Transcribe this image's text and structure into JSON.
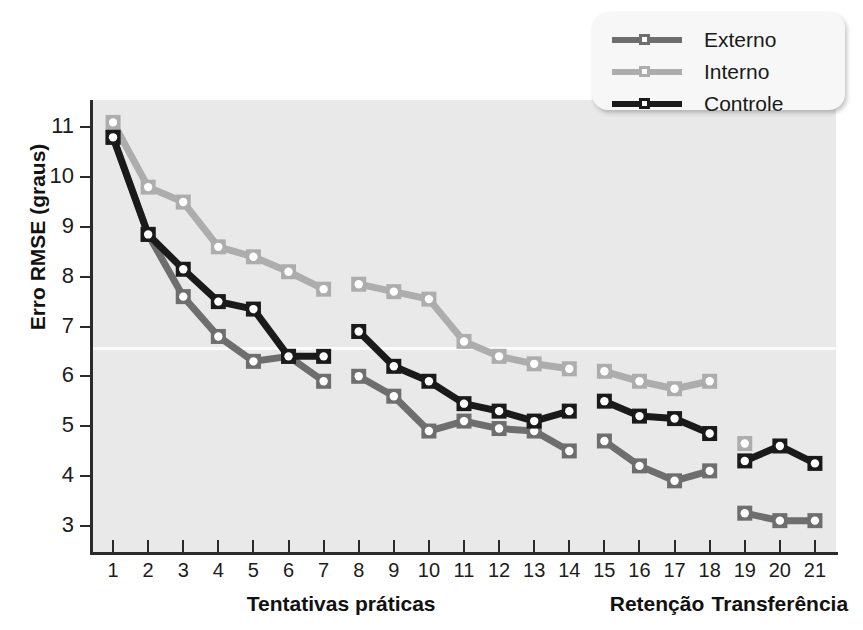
{
  "chart_data": {
    "type": "line",
    "title": "",
    "xlabel": "Tentativas práticas",
    "ylabel": "Erro RMSE (graus)",
    "xlim": [
      0.4,
      21.6
    ],
    "ylim": [
      2.45,
      11.55
    ],
    "grid": false,
    "legend_position": "top-right",
    "y_ticks": [
      3,
      4,
      5,
      6,
      7,
      8,
      9,
      10,
      11
    ],
    "y_tick_labels": [
      "3",
      "4",
      "5",
      "6",
      "7",
      "8",
      "9",
      "10",
      "11"
    ],
    "x": [
      1,
      2,
      3,
      4,
      5,
      6,
      7,
      8,
      9,
      10,
      11,
      12,
      13,
      14,
      15,
      16,
      17,
      18,
      19,
      20,
      21
    ],
    "x_tick_labels": [
      "1",
      "2",
      "3",
      "4",
      "5",
      "6",
      "7",
      "8",
      "9",
      "10",
      "11",
      "12",
      "13",
      "14",
      "15",
      "16",
      "17",
      "18",
      "19",
      "20",
      "21"
    ],
    "x_group_labels": [
      {
        "label": "Tentativas práticas",
        "center_x": 7.5
      },
      {
        "label": "Retenção",
        "center_x": 16.5
      },
      {
        "label": "Transferência",
        "center_x": 20.0
      }
    ],
    "segments": [
      {
        "name": "practice",
        "x": [
          1,
          2,
          3,
          4,
          5,
          6,
          7
        ]
      },
      {
        "name": "practice2",
        "x": [
          8,
          9,
          10,
          11,
          12,
          13,
          14
        ]
      },
      {
        "name": "retention",
        "x": [
          15,
          16,
          17,
          18
        ]
      },
      {
        "name": "transfer",
        "x": [
          19,
          20,
          21
        ]
      }
    ],
    "series": [
      {
        "name": "Externo",
        "color": "#6e6e6e",
        "marker": "square-open",
        "values": [
          10.8,
          8.85,
          7.6,
          6.8,
          6.3,
          6.4,
          5.9,
          6.0,
          5.6,
          4.9,
          5.1,
          4.95,
          4.9,
          4.5,
          4.7,
          4.2,
          3.9,
          4.1,
          3.25,
          3.1,
          3.1
        ]
      },
      {
        "name": "Interno",
        "color": "#adadad",
        "marker": "square-open",
        "values": [
          11.1,
          9.8,
          9.5,
          8.6,
          8.4,
          8.1,
          7.75,
          7.85,
          7.7,
          7.55,
          6.7,
          6.4,
          6.25,
          6.15,
          6.1,
          5.9,
          5.75,
          5.9,
          4.65,
          null,
          null
        ]
      },
      {
        "name": "Controle",
        "color": "#1a1a1a",
        "marker": "square-open",
        "values": [
          10.8,
          8.85,
          8.15,
          7.5,
          7.35,
          6.4,
          6.4,
          6.9,
          6.2,
          5.9,
          5.45,
          5.3,
          5.1,
          5.3,
          5.5,
          5.2,
          5.15,
          4.85,
          4.3,
          4.6,
          4.25
        ]
      }
    ]
  },
  "legend": {
    "items": [
      {
        "label": "Externo",
        "color": "#6e6e6e"
      },
      {
        "label": "Interno",
        "color": "#adadad"
      },
      {
        "label": "Controle",
        "color": "#1a1a1a"
      }
    ]
  },
  "colors": {
    "plot_background": "#e9e9e9",
    "page_background": "#ffffff",
    "axis": "#2b2b2b",
    "externo": "#6e6e6e",
    "interno": "#adadad",
    "controle": "#1a1a1a"
  }
}
